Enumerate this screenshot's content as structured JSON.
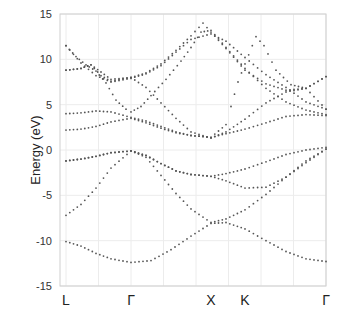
{
  "chart_data": {
    "type": "scatter",
    "title": "",
    "xlabel": "",
    "ylabel": "Energy (eV)",
    "ylim": [
      -15,
      15
    ],
    "yticks": [
      15,
      10,
      5,
      0,
      -5,
      -10,
      -15
    ],
    "grid": true,
    "high_symmetry_points": [
      {
        "label": "L",
        "k": 0
      },
      {
        "label": "Γ",
        "k": 65
      },
      {
        "label": "X",
        "k": 145
      },
      {
        "label": "K",
        "k": 179
      },
      {
        "label": "Γ",
        "k": 260
      }
    ],
    "k_range": [
      0,
      260
    ],
    "series": [
      {
        "name": "band1",
        "points": [
          [
            0,
            -10.1
          ],
          [
            15,
            -10.6
          ],
          [
            30,
            -11.4
          ],
          [
            45,
            -12.0
          ],
          [
            65,
            -12.4
          ],
          [
            85,
            -12.2
          ],
          [
            105,
            -11.0
          ],
          [
            125,
            -9.5
          ],
          [
            145,
            -8.1
          ],
          [
            160,
            -8.0
          ],
          [
            179,
            -8.7
          ],
          [
            200,
            -10.0
          ],
          [
            220,
            -11.2
          ],
          [
            240,
            -12.0
          ],
          [
            260,
            -12.3
          ]
        ]
      },
      {
        "name": "band2",
        "points": [
          [
            0,
            -7.2
          ],
          [
            15,
            -6.0
          ],
          [
            30,
            -4.2
          ],
          [
            45,
            -2.0
          ],
          [
            65,
            -0.1
          ],
          [
            80,
            -0.8
          ],
          [
            95,
            -2.8
          ],
          [
            110,
            -4.8
          ],
          [
            125,
            -6.5
          ],
          [
            145,
            -8.0
          ],
          [
            160,
            -7.6
          ],
          [
            179,
            -6.6
          ],
          [
            200,
            -4.9
          ],
          [
            220,
            -3.0
          ],
          [
            240,
            -1.2
          ],
          [
            260,
            0.1
          ]
        ]
      },
      {
        "name": "band3",
        "points": [
          [
            0,
            -1.2
          ],
          [
            15,
            -1.0
          ],
          [
            30,
            -0.7
          ],
          [
            45,
            -0.3
          ],
          [
            65,
            -0.1
          ],
          [
            80,
            -0.6
          ],
          [
            95,
            -1.5
          ],
          [
            110,
            -2.3
          ],
          [
            125,
            -2.7
          ],
          [
            145,
            -2.9
          ],
          [
            160,
            -3.4
          ],
          [
            179,
            -4.2
          ],
          [
            200,
            -4.1
          ],
          [
            220,
            -3.0
          ],
          [
            240,
            -1.4
          ],
          [
            260,
            0.1
          ]
        ]
      },
      {
        "name": "band4",
        "points": [
          [
            0,
            -1.2
          ],
          [
            15,
            -1.0
          ],
          [
            30,
            -0.7
          ],
          [
            45,
            -0.3
          ],
          [
            65,
            -0.1
          ],
          [
            80,
            -0.6
          ],
          [
            95,
            -1.5
          ],
          [
            110,
            -2.3
          ],
          [
            125,
            -2.7
          ],
          [
            145,
            -2.9
          ],
          [
            160,
            -2.6
          ],
          [
            179,
            -2.1
          ],
          [
            200,
            -1.3
          ],
          [
            220,
            -0.5
          ],
          [
            240,
            0.0
          ],
          [
            260,
            0.3
          ]
        ]
      },
      {
        "name": "band5",
        "points": [
          [
            0,
            2.2
          ],
          [
            15,
            2.3
          ],
          [
            30,
            2.6
          ],
          [
            45,
            3.1
          ],
          [
            65,
            3.5
          ],
          [
            80,
            3.0
          ],
          [
            95,
            2.4
          ],
          [
            110,
            1.9
          ],
          [
            125,
            1.6
          ],
          [
            145,
            1.4
          ],
          [
            160,
            1.8
          ],
          [
            179,
            2.3
          ],
          [
            200,
            3.0
          ],
          [
            220,
            3.7
          ],
          [
            240,
            3.9
          ],
          [
            260,
            3.8
          ]
        ]
      },
      {
        "name": "band6",
        "points": [
          [
            0,
            4.0
          ],
          [
            15,
            4.1
          ],
          [
            30,
            4.3
          ],
          [
            45,
            4.2
          ],
          [
            65,
            3.6
          ],
          [
            80,
            3.2
          ],
          [
            95,
            2.6
          ],
          [
            110,
            2.0
          ],
          [
            125,
            1.6
          ],
          [
            145,
            1.4
          ],
          [
            160,
            2.8
          ],
          [
            165,
            4.8
          ],
          [
            172,
            7.5
          ],
          [
            179,
            9.5
          ],
          [
            190,
            12.5
          ],
          [
            198,
            11.5
          ],
          [
            210,
            8.8
          ],
          [
            225,
            7.2
          ],
          [
            240,
            6.8
          ],
          [
            260,
            8.1
          ]
        ]
      },
      {
        "name": "band7",
        "points": [
          [
            0,
            8.8
          ],
          [
            15,
            9.0
          ],
          [
            25,
            9.4
          ],
          [
            35,
            8.2
          ],
          [
            45,
            7.6
          ],
          [
            65,
            8.0
          ],
          [
            80,
            6.9
          ],
          [
            95,
            5.2
          ],
          [
            110,
            3.5
          ],
          [
            125,
            2.0
          ],
          [
            145,
            1.3
          ],
          [
            160,
            2.0
          ],
          [
            179,
            3.4
          ],
          [
            200,
            5.2
          ],
          [
            220,
            6.4
          ],
          [
            240,
            6.8
          ],
          [
            260,
            4.5
          ]
        ]
      },
      {
        "name": "band8",
        "points": [
          [
            0,
            11.5
          ],
          [
            10,
            10.3
          ],
          [
            20,
            9.4
          ],
          [
            30,
            8.7
          ],
          [
            40,
            7.4
          ],
          [
            50,
            5.5
          ],
          [
            60,
            4.5
          ],
          [
            65,
            4.2
          ],
          [
            75,
            4.8
          ],
          [
            85,
            6.0
          ],
          [
            100,
            7.8
          ],
          [
            115,
            9.8
          ],
          [
            125,
            11.3
          ],
          [
            135,
            13.0
          ],
          [
            145,
            13.2
          ],
          [
            160,
            11.3
          ],
          [
            179,
            9.0
          ],
          [
            200,
            6.8
          ],
          [
            220,
            5.3
          ],
          [
            240,
            4.4
          ],
          [
            260,
            3.9
          ]
        ]
      },
      {
        "name": "band9",
        "points": [
          [
            0,
            8.8
          ],
          [
            15,
            9.0
          ],
          [
            25,
            9.4
          ],
          [
            35,
            8.6
          ],
          [
            45,
            7.8
          ],
          [
            65,
            8.0
          ],
          [
            80,
            8.5
          ],
          [
            95,
            9.5
          ],
          [
            110,
            11.0
          ],
          [
            125,
            12.6
          ],
          [
            137,
            14.0
          ],
          [
            145,
            13.0
          ],
          [
            160,
            11.2
          ],
          [
            179,
            8.8
          ],
          [
            200,
            7.3
          ],
          [
            220,
            6.6
          ],
          [
            240,
            6.8
          ],
          [
            260,
            8.1
          ]
        ]
      },
      {
        "name": "band10",
        "points": [
          [
            0,
            11.5
          ],
          [
            15,
            9.6
          ],
          [
            30,
            8.2
          ],
          [
            45,
            7.5
          ],
          [
            65,
            7.9
          ],
          [
            80,
            8.4
          ],
          [
            95,
            9.3
          ],
          [
            110,
            10.8
          ],
          [
            125,
            12.2
          ],
          [
            145,
            12.8
          ],
          [
            160,
            12.0
          ],
          [
            179,
            10.2
          ],
          [
            200,
            8.3
          ],
          [
            220,
            6.9
          ],
          [
            240,
            5.3
          ],
          [
            260,
            4.5
          ]
        ]
      }
    ]
  },
  "axes": {
    "ylabel": "Energy (eV)",
    "yticks": [
      "15",
      "10",
      "5",
      "0",
      "-5",
      "-10",
      "-15"
    ],
    "klabels": [
      "L",
      "Γ",
      "X",
      "K",
      "Γ"
    ]
  }
}
